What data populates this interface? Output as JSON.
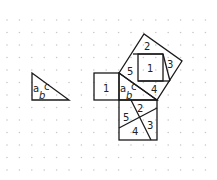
{
  "diagram": {
    "colors": {
      "stroke": "#1a1a1a",
      "dot": "#c8c8c8",
      "background": "#ffffff"
    },
    "small_triangle": {
      "side_labels": {
        "a": "a",
        "b": "b",
        "c": "c"
      }
    },
    "left_square": {
      "label": "1"
    },
    "central_triangle": {
      "side_labels": {
        "a": "a",
        "b": "b",
        "c": "c"
      }
    },
    "hypotenuse_square": {
      "pieces": [
        {
          "label": "1"
        },
        {
          "label": "2"
        },
        {
          "label": "3"
        },
        {
          "label": "4"
        },
        {
          "label": "5"
        }
      ]
    },
    "lower_square": {
      "pieces": [
        {
          "label": "2"
        },
        {
          "label": "3"
        },
        {
          "label": "4"
        },
        {
          "label": "5"
        }
      ]
    }
  }
}
